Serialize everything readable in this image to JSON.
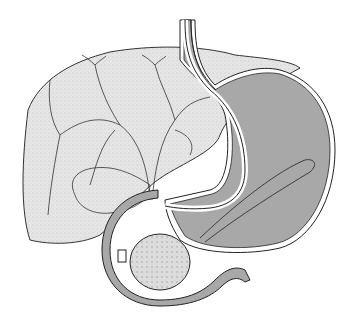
{
  "figure": {
    "type": "medical-illustration",
    "colors": {
      "background": "#ffffff",
      "liver": "#e4e4e4",
      "stomach": "#a9a9a9",
      "wall": "#ffffff",
      "outline": "#222222",
      "pancreas": "#d8d8d8"
    }
  }
}
